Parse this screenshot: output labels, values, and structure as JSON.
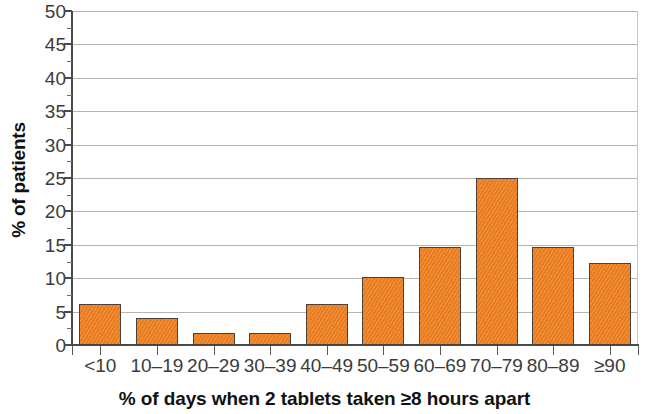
{
  "chart_data": {
    "type": "bar",
    "title": "",
    "xlabel": "% of days when 2 tablets taken ≥8 hours apart",
    "ylabel": "% of patients",
    "categories": [
      "<10",
      "10–19",
      "20–29",
      "30–39",
      "40–49",
      "50–59",
      "60–69",
      "70–79",
      "80–89",
      "≥90"
    ],
    "values": [
      6.2,
      4.1,
      1.8,
      1.8,
      6.1,
      10.2,
      14.6,
      25.0,
      14.6,
      12.3
    ],
    "ylim": [
      0,
      50
    ],
    "yticks": [
      0,
      5,
      10,
      15,
      20,
      25,
      30,
      35,
      40,
      45,
      50
    ],
    "ytick_labels": [
      "0",
      "5",
      "10",
      "15",
      "20",
      "25",
      "30",
      "35",
      "40",
      "45",
      "50"
    ],
    "yminor_ticks": [
      2.5,
      7.5,
      12.5,
      17.5,
      22.5,
      27.5,
      32.5,
      37.5,
      42.5,
      47.5
    ],
    "grid": "horizontal",
    "legend": "none",
    "bar_color": "#ed8022",
    "bar_edge_color": "#4d4038",
    "grid_color": "#b4b4b4",
    "axis_color": "#4a4a4a"
  }
}
